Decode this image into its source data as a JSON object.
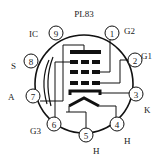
{
  "title": "PL83",
  "colors": {
    "stroke": "#111111",
    "text": "#222222",
    "background": "#ffffff"
  },
  "pins": [
    {
      "number": "1",
      "label": "G2"
    },
    {
      "number": "2",
      "label": "G1"
    },
    {
      "number": "3",
      "label": "K"
    },
    {
      "number": "4",
      "label": "H"
    },
    {
      "number": "5",
      "label": "H"
    },
    {
      "number": "6",
      "label": "G3"
    },
    {
      "number": "7",
      "label": "A"
    },
    {
      "number": "8",
      "label": "S"
    },
    {
      "number": "9",
      "label": "IC"
    }
  ]
}
